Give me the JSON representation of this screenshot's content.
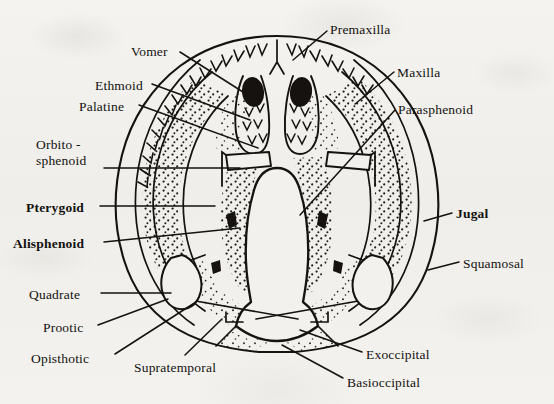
{
  "figure": {
    "background_color": "#f2f1ee",
    "ink_color": "#15120f"
  },
  "labels": [
    {
      "id": "vomer",
      "text": "Vomer",
      "x": 131,
      "y": 45,
      "bold": false,
      "align": "left"
    },
    {
      "id": "premaxilla",
      "text": "Premaxilla",
      "x": 330,
      "y": 23,
      "bold": false,
      "align": "left"
    },
    {
      "id": "ethmoid",
      "text": "Ethmoid",
      "x": 95,
      "y": 79,
      "bold": false,
      "align": "left"
    },
    {
      "id": "maxilla",
      "text": "Maxilla",
      "x": 397,
      "y": 66,
      "bold": false,
      "align": "left"
    },
    {
      "id": "palatine",
      "text": "Palatine",
      "x": 79,
      "y": 100,
      "bold": false,
      "align": "left"
    },
    {
      "id": "parasphenoid",
      "text": "Parasphenoid",
      "x": 398,
      "y": 103,
      "bold": false,
      "align": "left"
    },
    {
      "id": "orbitosphenoid",
      "text": "Orbito -\nsphenoid",
      "x": 36,
      "y": 137,
      "bold": false,
      "align": "left"
    },
    {
      "id": "pterygoid",
      "text": "Pterygoid",
      "x": 26,
      "y": 201,
      "bold": true,
      "align": "left"
    },
    {
      "id": "jugal",
      "text": "Jugal",
      "x": 456,
      "y": 207,
      "bold": true,
      "align": "left"
    },
    {
      "id": "alisphenoid",
      "text": "Alisphenoid",
      "x": 13,
      "y": 237,
      "bold": true,
      "align": "left"
    },
    {
      "id": "squamosal",
      "text": "Squamosal",
      "x": 463,
      "y": 257,
      "bold": false,
      "align": "left"
    },
    {
      "id": "quadrate",
      "text": "Quadrate",
      "x": 29,
      "y": 288,
      "bold": false,
      "align": "left"
    },
    {
      "id": "prootic",
      "text": "Prootic",
      "x": 43,
      "y": 321,
      "bold": false,
      "align": "left"
    },
    {
      "id": "opisthotic",
      "text": "Opisthotic",
      "x": 31,
      "y": 352,
      "bold": false,
      "align": "left"
    },
    {
      "id": "supratemporal",
      "text": "Supratemporal",
      "x": 134,
      "y": 361,
      "bold": false,
      "align": "left"
    },
    {
      "id": "exoccipital",
      "text": "Exoccipital",
      "x": 366,
      "y": 348,
      "bold": false,
      "align": "left"
    },
    {
      "id": "basioccipital",
      "text": "Basioccipital",
      "x": 347,
      "y": 376,
      "bold": false,
      "align": "left"
    }
  ],
  "leaders": [
    {
      "id": "vomer",
      "path": "M 180 52  L 243 92"
    },
    {
      "id": "premaxilla",
      "path": "M 327 31  L 293 60"
    },
    {
      "id": "ethmoid",
      "path": "M 152 84  L 250 120"
    },
    {
      "id": "maxilla",
      "path": "M 394 72  L 355 104"
    },
    {
      "id": "palatine",
      "path": "M 139 105 L 258 148"
    },
    {
      "id": "parasphenoid",
      "path": "M 395 110 L 300 215"
    },
    {
      "id": "orbitosphenoid",
      "path": "M 104 168 L 240 168"
    },
    {
      "id": "pterygoid",
      "path": "M 100 206 L 215 206"
    },
    {
      "id": "jugal",
      "path": "M 452 213 L 424 221"
    },
    {
      "id": "alisphenoid",
      "path": "M 104 242 L 240 228"
    },
    {
      "id": "squamosal",
      "path": "M 459 262 L 428 270"
    },
    {
      "id": "quadrate",
      "path": "M 101 293 L 171 293"
    },
    {
      "id": "prootic",
      "path": "M 98 325 L 168 299"
    },
    {
      "id": "opisthotic",
      "path": "M 115 354 L 196 302"
    },
    {
      "id": "supratemporal",
      "path": "M 185 355 L 222 319"
    },
    {
      "id": "exoccipital",
      "path": "M 362 352 L 300 330"
    },
    {
      "id": "basioccipital",
      "path": "M 343 378 L 282 345"
    }
  ],
  "anatomy": {
    "outer_skull_outline": "Broad rounded-triangular skull outline, widest at the posterior quadrate/squamosal region.",
    "regions": [
      "premaxilla",
      "maxilla",
      "vomer",
      "ethmoid",
      "palatine",
      "parasphenoid",
      "orbitosphenoid",
      "pterygoid",
      "alisphenoid",
      "jugal",
      "squamosal",
      "quadrate",
      "prootic",
      "opisthotic",
      "supratemporal",
      "exoccipital",
      "basioccipital"
    ],
    "features": {
      "teeth": "V-shaped tooth row along the anterior and lateral jaw margin",
      "nares": "Paired solid-black oval openings near the snout",
      "stippling": "Dotted shading indicating bone surfaces"
    }
  }
}
